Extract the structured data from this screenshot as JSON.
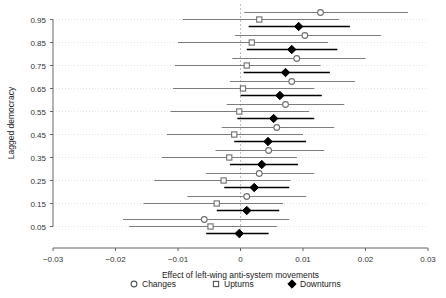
{
  "chart_data": {
    "type": "scatter",
    "title": "",
    "xlabel": "Effect of left-wing anti-system movements",
    "ylabel": "Lagged democracy",
    "xlim": [
      -0.03,
      0.03
    ],
    "ylim": [
      0.0,
      1.0
    ],
    "xticks": [
      -0.03,
      -0.02,
      -0.01,
      0,
      0.01,
      0.02,
      0.03
    ],
    "xticklabels": [
      "−0.03",
      "−0.02",
      "−0.01",
      "0",
      "0.01",
      "0.02",
      "0.03"
    ],
    "yticks": [
      0.05,
      0.15,
      0.25,
      0.35,
      0.45,
      0.55,
      0.65,
      0.75,
      0.85,
      0.95
    ],
    "yticklabels": [
      "0.05",
      "0.15",
      "0.25",
      "0.35",
      "0.45",
      "0.55",
      "0.65",
      "0.75",
      "0.85",
      "0.95"
    ],
    "grid": "horizontal-dotted",
    "reference_line": 0,
    "legend_position": "bottom",
    "marker_styles": {
      "Changes": "open-circle",
      "Upturns": "open-square",
      "Downturns": "filled-diamond"
    },
    "categories": [
      0.95,
      0.85,
      0.75,
      0.65,
      0.55,
      0.45,
      0.35,
      0.25,
      0.15,
      0.05
    ],
    "series": [
      {
        "name": "Changes",
        "marker": "open-circle",
        "color": "#808080",
        "estimates": [
          0.0128,
          0.0103,
          0.009,
          0.0082,
          0.0072,
          0.0058,
          0.0045,
          0.003,
          0.001,
          -0.0058
        ],
        "ci_low": [
          0.0006,
          -0.0009,
          -0.0013,
          -0.0017,
          -0.0022,
          -0.003,
          -0.004,
          -0.0055,
          -0.0085,
          -0.0188
        ],
        "ci_high": [
          0.0268,
          0.0225,
          0.02,
          0.0183,
          0.0166,
          0.015,
          0.0134,
          0.0118,
          0.0105,
          0.0078
        ]
      },
      {
        "name": "Upturns",
        "marker": "open-square",
        "color": "#808080",
        "estimates": [
          0.003,
          0.0018,
          0.001,
          0.0004,
          -0.0002,
          -0.001,
          -0.0018,
          -0.0027,
          -0.0038,
          -0.0048
        ],
        "ci_low": [
          -0.0092,
          -0.01,
          -0.0105,
          -0.0108,
          -0.0112,
          -0.0118,
          -0.0126,
          -0.0138,
          -0.0155,
          -0.0178
        ],
        "ci_high": [
          0.0158,
          0.014,
          0.0128,
          0.0118,
          0.011,
          0.01,
          0.009,
          0.008,
          0.0068,
          0.0058
        ]
      },
      {
        "name": "Downturns",
        "marker": "filled-diamond",
        "color": "#000000",
        "estimates": [
          0.0093,
          0.0082,
          0.0072,
          0.0063,
          0.0053,
          0.0044,
          0.0034,
          0.0022,
          0.001,
          -0.0002
        ],
        "ci_low": [
          0.0013,
          0.001,
          0.0005,
          0.0,
          -0.0005,
          -0.001,
          -0.0017,
          -0.0026,
          -0.0038,
          -0.0055
        ],
        "ci_high": [
          0.0175,
          0.0155,
          0.0143,
          0.013,
          0.0118,
          0.0105,
          0.0092,
          0.0078,
          0.0062,
          0.0045
        ]
      }
    ]
  },
  "axes": {
    "x_title": "Effect of left-wing anti-system movements",
    "y_title": "Lagged democracy"
  },
  "legend": {
    "items": [
      {
        "label": "Changes",
        "marker": "open-circle"
      },
      {
        "label": "Upturns",
        "marker": "open-square"
      },
      {
        "label": "Downturns",
        "marker": "filled-diamond"
      }
    ]
  }
}
